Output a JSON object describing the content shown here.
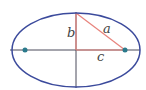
{
  "diagram": {
    "type": "ellipse-foci",
    "labels": {
      "a": "a",
      "b": "b",
      "c": "c"
    },
    "colors": {
      "ellipse": "#3b4a9c",
      "axes": "#4a4a5a",
      "triangle": "#e8837c",
      "foci": "#2a7a8c",
      "label": "#444444"
    },
    "geometry": {
      "center": [
        76,
        50
      ],
      "semi_major": 64,
      "semi_minor": 37,
      "foci": [
        [
          25,
          50
        ],
        [
          125,
          50
        ]
      ]
    }
  }
}
